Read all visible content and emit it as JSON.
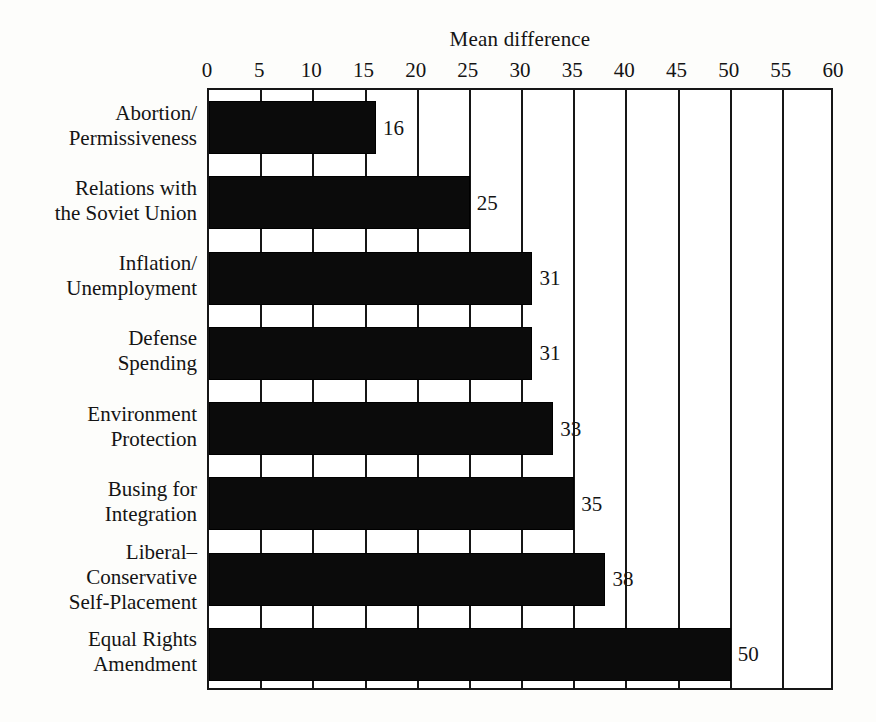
{
  "chart_data": {
    "type": "bar",
    "orientation": "horizontal",
    "title": "Mean difference",
    "xlabel": "",
    "ylabel": "",
    "xlim": [
      0,
      60
    ],
    "xticks": [
      0,
      5,
      10,
      15,
      20,
      25,
      30,
      35,
      40,
      45,
      50,
      55,
      60
    ],
    "xtick_labels": [
      "0",
      "5",
      "10",
      "15",
      "20",
      "25",
      "30",
      "35",
      "40",
      "45",
      "50",
      "55",
      "60"
    ],
    "grid": true,
    "grid_axis": "x",
    "legend": false,
    "bar_color": "#0b0b0b",
    "background_color": "#fdfdfb",
    "axis_color": "#161616",
    "categories": [
      "Abortion/ Permissiveness",
      "Relations with the Soviet Union",
      "Inflation/ Unemployment",
      "Defense Spending",
      "Environment Protection",
      "Busing for Integration",
      "Liberal– Conservative Self-Placement",
      "Equal Rights Amendment"
    ],
    "values": [
      16,
      25,
      31,
      31,
      33,
      35,
      38,
      50
    ],
    "value_labels": [
      "16",
      "25",
      "31",
      "31",
      "33",
      "35",
      "38",
      "50"
    ],
    "bars": [
      {
        "label_lines": [
          "Abortion/",
          "Permissiveness"
        ],
        "value": 16,
        "value_label": "16"
      },
      {
        "label_lines": [
          "Relations with",
          "the Soviet Union"
        ],
        "value": 25,
        "value_label": "25"
      },
      {
        "label_lines": [
          "Inflation/",
          "Unemployment"
        ],
        "value": 31,
        "value_label": "31"
      },
      {
        "label_lines": [
          "Defense",
          "Spending"
        ],
        "value": 31,
        "value_label": "31"
      },
      {
        "label_lines": [
          "Environment",
          "Protection"
        ],
        "value": 33,
        "value_label": "33"
      },
      {
        "label_lines": [
          "Busing for",
          "Integration"
        ],
        "value": 35,
        "value_label": "35"
      },
      {
        "label_lines": [
          "Liberal–",
          "Conservative",
          "Self-Placement"
        ],
        "value": 38,
        "value_label": "38"
      },
      {
        "label_lines": [
          "Equal Rights",
          "Amendment"
        ],
        "value": 50,
        "value_label": "50"
      }
    ]
  }
}
